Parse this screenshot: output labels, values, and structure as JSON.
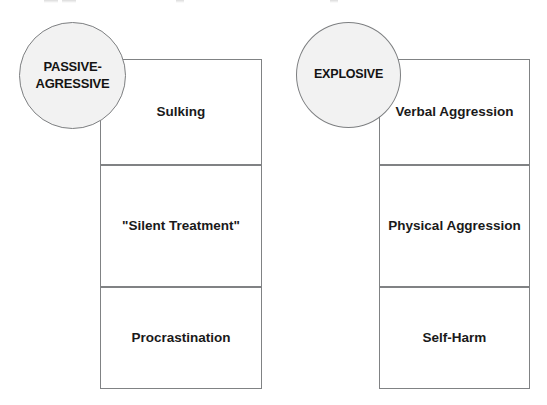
{
  "diagram": {
    "type": "two-column-category-diagram",
    "background_color": "#ffffff",
    "border_color": "#808284",
    "circle_fill_color": "#f2f2f2",
    "text_color": "#1a1a1a",
    "columns": [
      {
        "circle_label": "PASSIVE-\nAGRESSIVE",
        "items": [
          {
            "label": "Sulking"
          },
          {
            "label": "\"Silent Treatment\""
          },
          {
            "label": "Procrastination"
          }
        ]
      },
      {
        "circle_label": "EXPLOSIVE",
        "items": [
          {
            "label": "Verbal\nAggression"
          },
          {
            "label": "Physical Aggression"
          },
          {
            "label": "Self-Harm"
          }
        ]
      }
    ]
  }
}
